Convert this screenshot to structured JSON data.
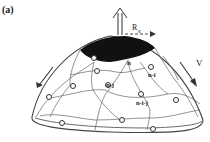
{
  "figure": {
    "panel_label": "(a)",
    "labels": {
      "radius": "R",
      "radius_subscript": "g",
      "velocity": "V",
      "node_n": "n",
      "node_n_i": "n-i",
      "node_n_j": "n-j",
      "node_n_i_j": "n-i-j"
    },
    "colors": {
      "line": "#555555",
      "cap": "#111111",
      "background": "#ffffff"
    }
  }
}
